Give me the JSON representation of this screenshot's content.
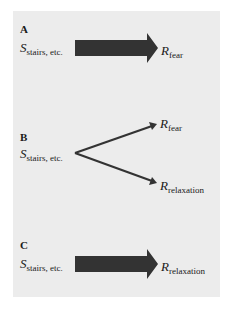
{
  "panels": {
    "A": {
      "label": "A",
      "stimulus": {
        "base": "S",
        "sub": "stairs, etc."
      },
      "response": {
        "base": "R",
        "sub": "fear"
      },
      "arrow": "thick"
    },
    "B": {
      "label": "B",
      "stimulus": {
        "base": "S",
        "sub": "stairs, etc."
      },
      "responses": [
        {
          "base": "R",
          "sub": "fear"
        },
        {
          "base": "R",
          "sub": "relaxation"
        }
      ],
      "arrow": "thin-branching"
    },
    "C": {
      "label": "C",
      "stimulus": {
        "base": "S",
        "sub": "stairs, etc."
      },
      "response": {
        "base": "R",
        "sub": "relaxation"
      },
      "arrow": "thick"
    }
  },
  "colors": {
    "background": "#ececec",
    "arrow": "#333333",
    "text": "#1a1a1a"
  }
}
